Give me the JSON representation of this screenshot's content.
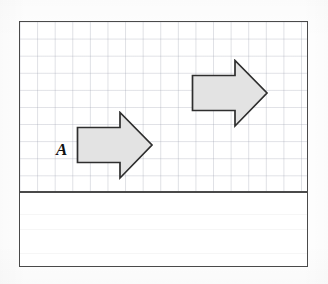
{
  "figure": {
    "kind": "geometry-worksheet-figure",
    "frame": {
      "x": 19,
      "y": 21,
      "width": 289,
      "height": 246,
      "border_color": "#4a4a4a",
      "border_width": 1.6,
      "background": "#ffffff"
    },
    "grid_panel": {
      "name": "grid-panel",
      "height": 169,
      "grid_visible": true,
      "grid_color": "#969baa",
      "grid_cell_width": 17.6,
      "grid_cell_height": 17.1,
      "columns": 16,
      "rows": 10
    },
    "divider": {
      "name": "panel-divider",
      "y": 169,
      "color": "#4a4a4a",
      "thickness": 1.6
    },
    "answer_band": {
      "name": "answer-band",
      "height": 75,
      "background": "#ffffff",
      "grid_visible": false,
      "content": ""
    }
  },
  "shapes": [
    {
      "id": "arrow-a",
      "name": "arrow-shape-a",
      "role": "pre-image",
      "direction": "right",
      "label": "A",
      "fill": "#e3e3e3",
      "stroke": "#2e2e2e",
      "stroke_width": 1.6,
      "position": {
        "x": 56,
        "y": 89
      },
      "size": {
        "width": 74,
        "height": 66
      },
      "grid_cells": {
        "shaft_length": 3,
        "shaft_height": 2,
        "head_width": 2,
        "head_height": 4
      }
    },
    {
      "id": "arrow-b",
      "name": "arrow-shape-b",
      "role": "image",
      "direction": "right",
      "label": "",
      "fill": "#e3e3e3",
      "stroke": "#2e2e2e",
      "stroke_width": 1.6,
      "position": {
        "x": 171,
        "y": 37
      },
      "size": {
        "width": 74,
        "height": 66
      },
      "grid_cells": {
        "shaft_length": 3,
        "shaft_height": 2,
        "head_width": 2,
        "head_height": 4
      }
    }
  ],
  "labels": [
    {
      "id": "label-a",
      "name": "shape-label-a",
      "text": "A",
      "x": 36,
      "y": 119,
      "font_size": 17,
      "bold": true,
      "italic": true,
      "color": "#111111"
    }
  ],
  "colors": {
    "frame_stroke": "#4a4a4a",
    "shape_stroke": "#2e2e2e",
    "shape_fill": "#e3e3e3",
    "grid_line": "#969baa",
    "paper": "#ffffff",
    "ink": "#111111"
  }
}
